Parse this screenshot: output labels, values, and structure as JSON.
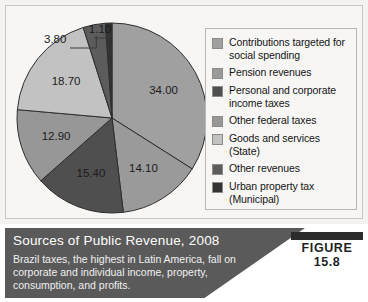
{
  "figure": {
    "badge": "FIGURE 15.8",
    "title": "Sources of Public Revenue, 2008",
    "body": "Brazil taxes, the highest in Latin America, fall on corporate and individual income, property, consumption, and profits."
  },
  "legend": {
    "items": [
      {
        "label": "Contributions targeted for social spending",
        "color": "#a0a0a0"
      },
      {
        "label": "Pension revenues",
        "color": "#9a9a9a"
      },
      {
        "label": "Personal and corporate income taxes",
        "color": "#4f4f4f"
      },
      {
        "label": "Other federal taxes",
        "color": "#979797"
      },
      {
        "label": "Goods and services (State)",
        "color": "#c2c2c2"
      },
      {
        "label": "Other revenues",
        "color": "#5c5c5c"
      },
      {
        "label": "Urban property tax (Municipal)",
        "color": "#333333"
      }
    ]
  },
  "chart_data": {
    "type": "pie",
    "title": "Sources of Public Revenue, 2008",
    "unit": "percent",
    "legend_position": "right",
    "start_angle_deg": 0,
    "direction": "clockwise",
    "categories": [
      "Contributions targeted for social spending",
      "Pension revenues",
      "Personal and corporate income taxes",
      "Other federal taxes",
      "Goods and services (State)",
      "Other revenues",
      "Urban property tax (Municipal)"
    ],
    "values": [
      34.0,
      14.1,
      15.4,
      12.9,
      18.7,
      3.8,
      1.1
    ],
    "colors": [
      "#a0a0a0",
      "#9a9a9a",
      "#4f4f4f",
      "#979797",
      "#c2c2c2",
      "#5c5c5c",
      "#333333"
    ],
    "labels": [
      "34.00",
      "14.10",
      "15.40",
      "12.90",
      "18.70",
      "3.80",
      "1.10"
    ],
    "label_placement": [
      "inside",
      "inside",
      "inside",
      "inside",
      "inside",
      "callout",
      "callout"
    ],
    "total": 100.0
  }
}
